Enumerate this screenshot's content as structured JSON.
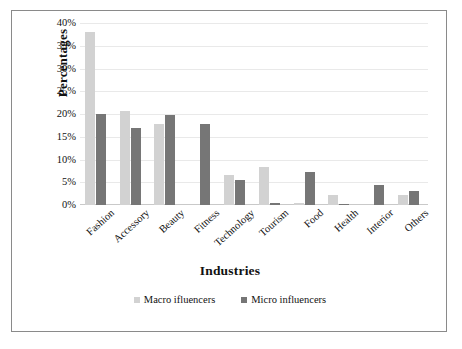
{
  "chart_data": {
    "type": "bar",
    "title": "",
    "xlabel": "Industries",
    "ylabel": "Percentages",
    "categories": [
      "Fashion",
      "Accessory",
      "Beauty",
      "Fitness",
      "Technology",
      "Tourism",
      "Food",
      "Health",
      "Interior",
      "Others"
    ],
    "series": [
      {
        "name": "Macro ifluencers",
        "color": "#d2d2d2",
        "values": [
          38.0,
          20.7,
          17.8,
          0.0,
          6.6,
          8.4,
          0.4,
          2.2,
          0.0,
          2.1
        ]
      },
      {
        "name": "Micro influencers",
        "color": "#767676",
        "values": [
          20.0,
          16.9,
          19.7,
          17.8,
          5.6,
          0.5,
          7.3,
          0.3,
          4.3,
          3.0
        ]
      }
    ],
    "ylim": [
      0,
      40
    ],
    "y_ticks": [
      "0%",
      "5%",
      "10%",
      "15%",
      "20%",
      "25%",
      "30%",
      "35%",
      "40%"
    ],
    "y_tick_values": [
      0,
      5,
      10,
      15,
      20,
      25,
      30,
      35,
      40
    ],
    "grid": true,
    "legend_position": "bottom"
  },
  "legend": {
    "items": [
      {
        "label": "Macro ifluencers",
        "swatch": "macro"
      },
      {
        "label": "Micro influencers",
        "swatch": "micro"
      }
    ]
  }
}
